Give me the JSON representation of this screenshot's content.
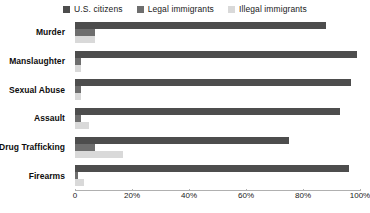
{
  "chart_data": {
    "type": "bar",
    "orientation": "horizontal",
    "title": "",
    "subtitle": "",
    "xlabel": "",
    "ylabel": "",
    "xlim": [
      0,
      100
    ],
    "grid": false,
    "legend_position": "top-center",
    "xticks": [
      {
        "label": "0",
        "value": 0
      },
      {
        "label": "20%",
        "value": 20
      },
      {
        "label": "40%",
        "value": 40
      },
      {
        "label": "60%",
        "value": 60
      },
      {
        "label": "80%",
        "value": 80
      },
      {
        "label": "100%",
        "value": 100
      }
    ],
    "categories": [
      "Murder",
      "Manslaughter",
      "Sexual Abuse",
      "Assault",
      "Drug Trafficking",
      "Firearms"
    ],
    "series": [
      {
        "name": "U.S. citizens",
        "color": "#4d4d4d",
        "values": [
          88,
          99,
          97,
          93,
          75,
          96
        ]
      },
      {
        "name": "Legal immigrants",
        "color": "#6e6e6e",
        "values": [
          7,
          2,
          2,
          2,
          7,
          1
        ]
      },
      {
        "name": "Illegal immigrants",
        "color": "#d9d9d9",
        "values": [
          7,
          2,
          2,
          5,
          17,
          3
        ]
      }
    ]
  },
  "legend": {
    "entries": [
      {
        "label": "U.S. citizens",
        "color": "#4d4d4d"
      },
      {
        "label": "Legal immigrants",
        "color": "#6e6e6e"
      },
      {
        "label": "Illegal immigrants",
        "color": "#d9d9d9"
      }
    ]
  },
  "colors": {
    "us_citizens": "#4d4d4d",
    "legal_immigrants": "#6e6e6e",
    "illegal_immigrants": "#d9d9d9",
    "axis": "#b0b0b0",
    "text": "#1a1a1a",
    "background": "#ffffff"
  }
}
